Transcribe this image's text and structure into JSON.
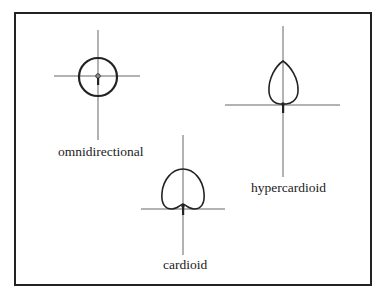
{
  "figure": {
    "patterns": [
      {
        "name": "omnidirectional",
        "label": "omnidirectional",
        "shape": "circle"
      },
      {
        "name": "cardioid",
        "label": "cardioid",
        "shape": "cardioid"
      },
      {
        "name": "hypercardioid",
        "label": "hypercardioid",
        "shape": "hypercardioid"
      }
    ],
    "colors": {
      "line": "#222222",
      "axis": "#555555",
      "background": "#ffffff"
    }
  }
}
